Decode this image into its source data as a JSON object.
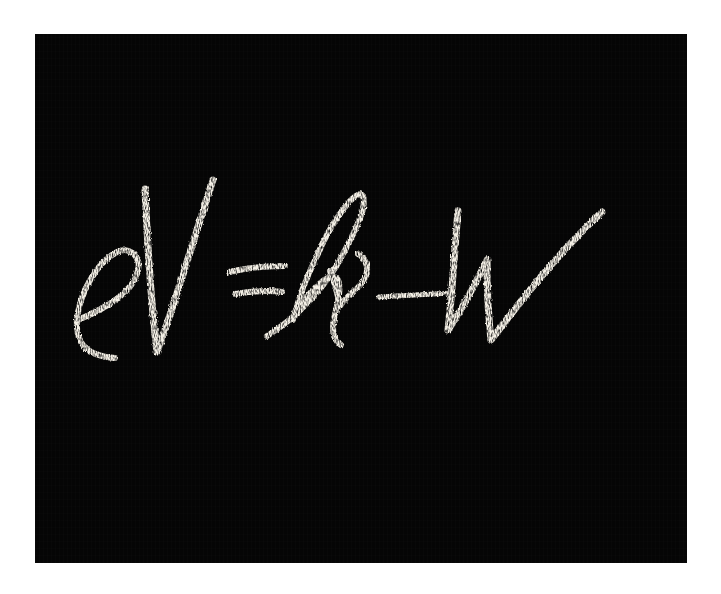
{
  "image": {
    "description": "Chalk handwriting on a black chalkboard",
    "formula_text": "eV = hν − W",
    "formula_name": "Photoelectric equation",
    "symbols": [
      "e",
      "V",
      "=",
      "h",
      "ν",
      "−",
      "W"
    ],
    "colors": {
      "background": "#ffffff",
      "chalkboard": "#050505",
      "chalk": "#f4f0e6"
    }
  }
}
